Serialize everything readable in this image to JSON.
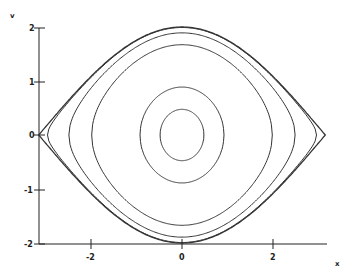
{
  "chart_data": {
    "type": "line",
    "title": "",
    "xlabel": "x",
    "ylabel": "v",
    "xlim": [
      -3.1416,
      3.1416
    ],
    "ylim": [
      -2,
      2
    ],
    "xticks": [
      "-2",
      "0",
      "2"
    ],
    "yticks": [
      "-2",
      "-1",
      "0",
      "1",
      "2"
    ],
    "grid": false,
    "legend": null,
    "series": [
      {
        "name": "orbit-1",
        "amplitude_x": 0.48,
        "max_v": 0.48
      },
      {
        "name": "orbit-2",
        "amplitude_x": 0.92,
        "max_v": 0.89
      },
      {
        "name": "orbit-3",
        "amplitude_x": 1.98,
        "max_v": 1.67
      },
      {
        "name": "orbit-4",
        "amplitude_x": 2.48,
        "max_v": 1.89
      },
      {
        "name": "orbit-5",
        "amplitude_x": 2.95,
        "max_v": 1.99
      },
      {
        "name": "separatrix",
        "amplitude_x": 3.1416,
        "max_v": 2.0
      }
    ]
  },
  "labels": {
    "x_axis": "x",
    "y_axis": "v",
    "xtick_neg2": "-2",
    "xtick_0": "0",
    "xtick_2": "2",
    "ytick_2": "2",
    "ytick_1": "1",
    "ytick_0": "0",
    "ytick_neg1": "-1",
    "ytick_neg2": "-2"
  }
}
